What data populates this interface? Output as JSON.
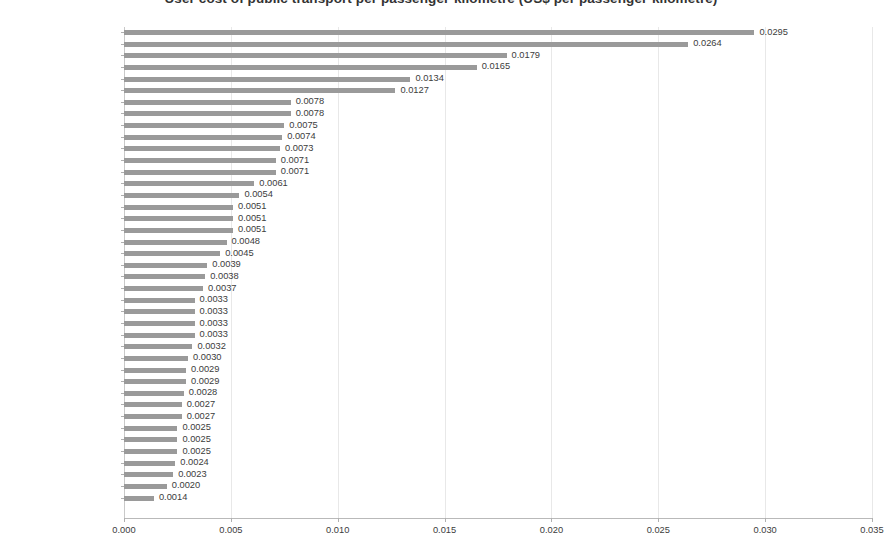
{
  "chart_data": {
    "type": "bar",
    "orientation": "horizontal",
    "title": "User cost of public transport per passenger-kilometre (US$ per passenger-kilometre)",
    "xlabel": "",
    "ylabel": "",
    "xlim": [
      0.0,
      0.035
    ],
    "xticks": [
      "0.000",
      "0.005",
      "0.010",
      "0.015",
      "0.020",
      "0.025",
      "0.030",
      "0.035"
    ],
    "xtick_values": [
      0.0,
      0.005,
      0.01,
      0.015,
      0.02,
      0.025,
      0.03,
      0.035
    ],
    "grid": "vertical",
    "legend": "none",
    "bar_color": "#9a9a9a",
    "categories": [
      "Ho Chi Minh City [TS]",
      "Manila [-]",
      "Harare [PT]",
      "Dakar [PT]",
      "Jakarta [TS]",
      "Riyadh [AU]",
      "Sao Paulo [HY]",
      "Bogota [PT]",
      "London [HY]",
      "Kuala Lumpur [TS]",
      "Cape Town [PT]",
      "Cairo [TS]",
      "Tehran [TS]",
      "Guangzhou [NM]",
      "Johannesburg [PT]",
      "Madrid [HY]",
      "Toronto [HY]",
      "Montreal [HY]",
      "Berlin [HY]",
      "Seoul [TR]",
      "Hong Kong [TR]",
      "Mumbai [NM]",
      "New York [HY]",
      "Washington [HY]",
      "Taipei [TS]",
      "Osaka [TR]",
      "Sydney [HY]",
      "Chicago [HY]",
      "Bangkok [TS]",
      "Los Angeles [HY]",
      "Shanghai [NM]",
      "Melbourne [HY]",
      "Tokyo [TR]",
      "Paris [HY]",
      "Phoenix [AU]",
      "Ruhr [HY]",
      "San Francisco [HY]",
      "Atlanta [HY]",
      "Singapore [TR]",
      "Houston [AU]",
      "Beijing [NM]"
    ],
    "values": [
      0.0295,
      0.0264,
      0.0179,
      0.0165,
      0.0134,
      0.0127,
      0.0078,
      0.0078,
      0.0075,
      0.0074,
      0.0073,
      0.0071,
      0.0071,
      0.0061,
      0.0054,
      0.0051,
      0.0051,
      0.0051,
      0.0048,
      0.0045,
      0.0039,
      0.0038,
      0.0037,
      0.0033,
      0.0033,
      0.0033,
      0.0033,
      0.0032,
      0.003,
      0.0029,
      0.0029,
      0.0028,
      0.0027,
      0.0027,
      0.0025,
      0.0025,
      0.0025,
      0.0024,
      0.0023,
      0.002,
      0.0014
    ],
    "value_labels": [
      "0.0295",
      "0.0264",
      "0.0179",
      "0.0165",
      "0.0134",
      "0.0127",
      "0.0078",
      "0.0078",
      "0.0075",
      "0.0074",
      "0.0073",
      "0.0071",
      "0.0071",
      "0.0061",
      "0.0054",
      "0.0051",
      "0.0051",
      "0.0051",
      "0.0048",
      "0.0045",
      "0.0039",
      "0.0038",
      "0.0037",
      "0.0033",
      "0.0033",
      "0.0033",
      "0.0033",
      "0.0032",
      "0.0030",
      "0.0029",
      "0.0029",
      "0.0028",
      "0.0027",
      "0.0027",
      "0.0025",
      "0.0025",
      "0.0025",
      "0.0024",
      "0.0023",
      "0.0020",
      "0.0014"
    ]
  }
}
